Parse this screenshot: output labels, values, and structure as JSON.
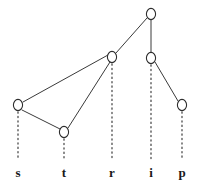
{
  "figure": {
    "type": "dependency-tree-diagram",
    "width": 212,
    "height": 186,
    "background_color": "#ffffff",
    "edge_color": "#3a3a3a",
    "node_fill_color": "#ffffff",
    "node_stroke_color": "#2d2d2d",
    "stem_color": "#4a4a4a",
    "label_color": "#1a1a1a"
  },
  "nodes": [
    {
      "id": "n-root",
      "glyph": "o",
      "x": 151,
      "y": 14,
      "rx": 4.6,
      "ry": 5.6
    },
    {
      "id": "n-r",
      "glyph": "o",
      "x": 112,
      "y": 57,
      "rx": 4.6,
      "ry": 5.6
    },
    {
      "id": "n-i",
      "glyph": "o",
      "x": 151,
      "y": 58,
      "rx": 4.6,
      "ry": 5.6
    },
    {
      "id": "n-s",
      "glyph": "o",
      "x": 18,
      "y": 105,
      "rx": 4.6,
      "ry": 5.6
    },
    {
      "id": "n-p",
      "glyph": "o",
      "x": 182,
      "y": 105,
      "rx": 4.6,
      "ry": 5.6
    },
    {
      "id": "n-t",
      "glyph": "o",
      "x": 64,
      "y": 132,
      "rx": 4.6,
      "ry": 5.6
    }
  ],
  "edges": [
    {
      "id": "edge-root-r",
      "from": "n-root",
      "to": "n-r",
      "x1": 147,
      "y1": 18,
      "x2": 116,
      "y2": 53
    },
    {
      "id": "edge-root-i",
      "from": "n-root",
      "to": "n-i",
      "x1": 151,
      "y1": 20,
      "x2": 151,
      "y2": 52
    },
    {
      "id": "edge-r-s",
      "from": "n-r",
      "to": "n-s",
      "x1": 108,
      "y1": 55,
      "x2": 23,
      "y2": 102
    },
    {
      "id": "edge-r-t",
      "from": "n-r",
      "to": "n-t",
      "x1": 110,
      "y1": 62,
      "x2": 68,
      "y2": 128
    },
    {
      "id": "edge-s-t",
      "from": "n-s",
      "to": "n-t",
      "x1": 22,
      "y1": 110,
      "x2": 60,
      "y2": 129
    },
    {
      "id": "edge-i-p",
      "from": "n-i",
      "to": "n-p",
      "x1": 155,
      "y1": 62,
      "x2": 178,
      "y2": 101
    }
  ],
  "stems": [
    {
      "id": "stem-s",
      "node": "n-s",
      "x": 18,
      "y1": 112,
      "y2": 160
    },
    {
      "id": "stem-t",
      "node": "n-t",
      "x": 64,
      "y1": 139,
      "y2": 160
    },
    {
      "id": "stem-r",
      "node": "n-r",
      "x": 112,
      "y1": 64,
      "y2": 160
    },
    {
      "id": "stem-i",
      "node": "n-i",
      "x": 151,
      "y1": 65,
      "y2": 160
    },
    {
      "id": "stem-p",
      "node": "n-p",
      "x": 182,
      "y1": 112,
      "y2": 160
    }
  ],
  "leaf_labels": [
    {
      "id": "label-s",
      "text": "s",
      "x": 18,
      "y": 166
    },
    {
      "id": "label-t",
      "text": "t",
      "x": 64,
      "y": 166
    },
    {
      "id": "label-r",
      "text": "r",
      "x": 112,
      "y": 166
    },
    {
      "id": "label-i",
      "text": "i",
      "x": 151,
      "y": 166
    },
    {
      "id": "label-p",
      "text": "p",
      "x": 182,
      "y": 166
    }
  ],
  "word": "strip"
}
